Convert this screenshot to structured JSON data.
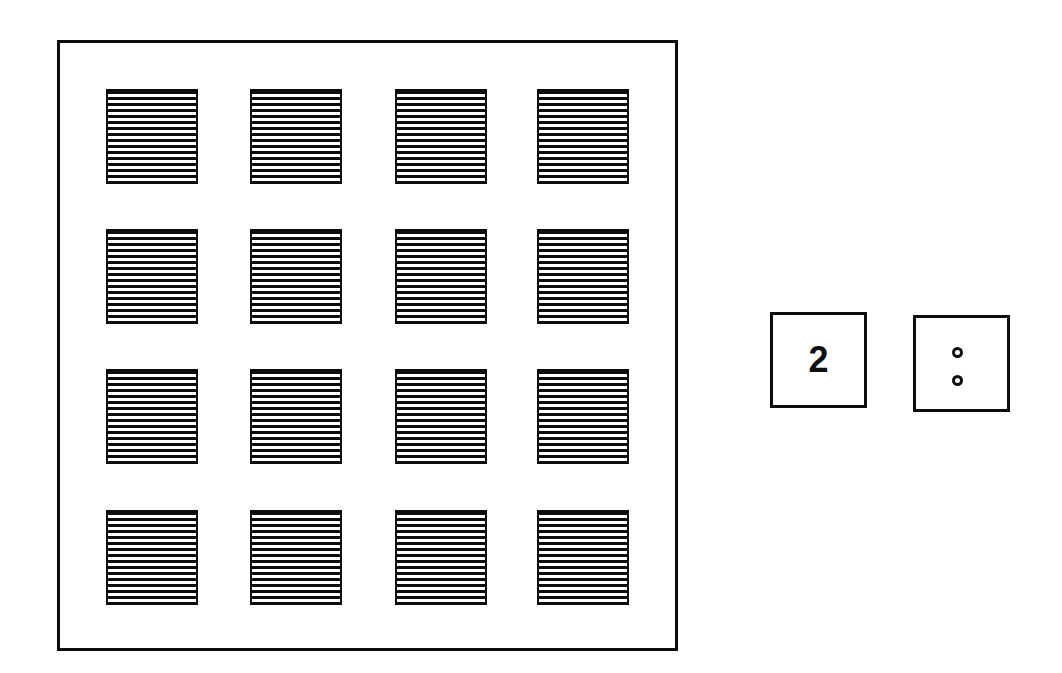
{
  "figure": {
    "background_color": "#ffffff",
    "ink_color": "#0d0d0d",
    "width": 1062,
    "height": 673
  },
  "panel": {
    "name": "outer frame",
    "x": 57,
    "y": 40,
    "width": 621,
    "height": 611,
    "border_width": 3,
    "border_color": "#0d0d0d",
    "fill_color": "#ffffff"
  },
  "grid": {
    "rows": 4,
    "columns": 4,
    "cell_count": 16,
    "cell_width": 92,
    "cell_height": 95,
    "column_x": [
      46,
      190,
      335,
      477
    ],
    "row_y": [
      46,
      186,
      326,
      467
    ],
    "fill_pattern": "horizontal-hatch",
    "hatch_line_count": 16,
    "hatch_pitch_px": 6,
    "hatch_line_color": "#0d0d0d",
    "cell_border_width": 2,
    "cells": [
      {
        "row": 1,
        "col": 1,
        "x": 46,
        "y": 46,
        "pattern": "horizontal-hatch"
      },
      {
        "row": 1,
        "col": 2,
        "x": 190,
        "y": 46,
        "pattern": "horizontal-hatch"
      },
      {
        "row": 1,
        "col": 3,
        "x": 335,
        "y": 46,
        "pattern": "horizontal-hatch"
      },
      {
        "row": 1,
        "col": 4,
        "x": 477,
        "y": 46,
        "pattern": "horizontal-hatch"
      },
      {
        "row": 2,
        "col": 1,
        "x": 46,
        "y": 186,
        "pattern": "horizontal-hatch"
      },
      {
        "row": 2,
        "col": 2,
        "x": 190,
        "y": 186,
        "pattern": "horizontal-hatch"
      },
      {
        "row": 2,
        "col": 3,
        "x": 335,
        "y": 186,
        "pattern": "horizontal-hatch"
      },
      {
        "row": 2,
        "col": 4,
        "x": 477,
        "y": 186,
        "pattern": "horizontal-hatch"
      },
      {
        "row": 3,
        "col": 1,
        "x": 46,
        "y": 326,
        "pattern": "horizontal-hatch"
      },
      {
        "row": 3,
        "col": 2,
        "x": 190,
        "y": 326,
        "pattern": "horizontal-hatch"
      },
      {
        "row": 3,
        "col": 3,
        "x": 335,
        "y": 326,
        "pattern": "horizontal-hatch"
      },
      {
        "row": 3,
        "col": 4,
        "x": 477,
        "y": 326,
        "pattern": "horizontal-hatch"
      },
      {
        "row": 4,
        "col": 1,
        "x": 46,
        "y": 467,
        "pattern": "horizontal-hatch"
      },
      {
        "row": 4,
        "col": 2,
        "x": 190,
        "y": 467,
        "pattern": "horizontal-hatch"
      },
      {
        "row": 4,
        "col": 3,
        "x": 335,
        "y": 467,
        "pattern": "horizontal-hatch"
      },
      {
        "row": 4,
        "col": 4,
        "x": 477,
        "y": 467,
        "pattern": "horizontal-hatch"
      }
    ]
  },
  "legend": {
    "number_box": {
      "label": "2",
      "x": 770,
      "y": 312,
      "width": 97,
      "height": 96
    },
    "dots_box": {
      "x": 913,
      "y": 315,
      "width": 97,
      "height": 97,
      "dot_count": 2,
      "dot_diameter": 11,
      "dots": [
        {
          "index": 1,
          "x": 36,
          "y": 29
        },
        {
          "index": 2,
          "x": 36,
          "y": 57
        }
      ]
    }
  }
}
